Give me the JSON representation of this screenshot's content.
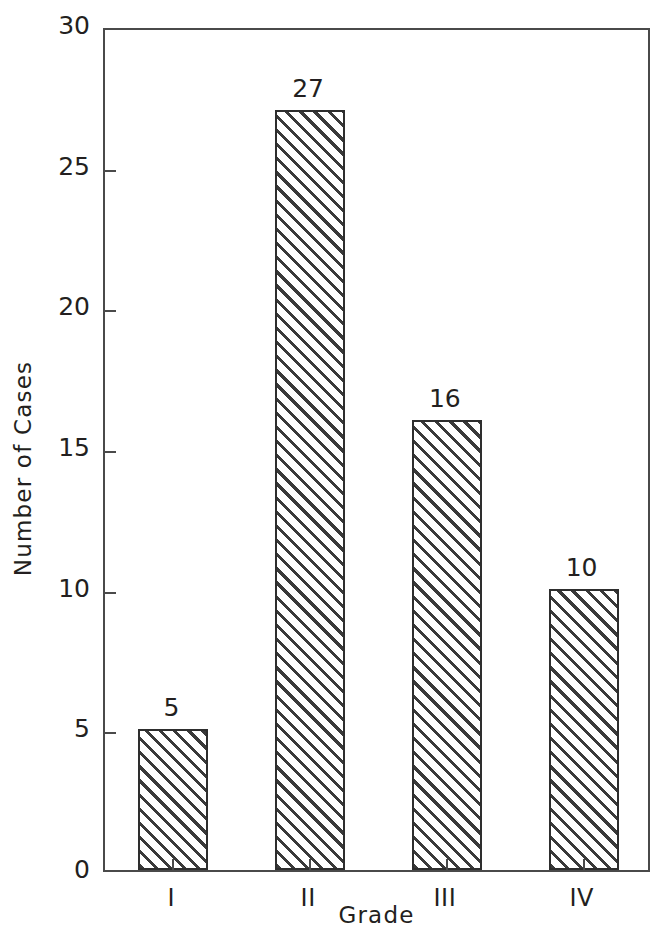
{
  "chart_data": {
    "type": "bar",
    "title": "",
    "subtitle": "",
    "xlabel": "Grade",
    "ylabel": "Number of Cases",
    "categories": [
      "I",
      "II",
      "III",
      "IV"
    ],
    "values": [
      5,
      27,
      16,
      10
    ],
    "value_labels": [
      "5",
      "27",
      "16",
      "10"
    ],
    "ylim": [
      0,
      30
    ],
    "yticks": [
      0,
      5,
      10,
      15,
      20,
      25,
      30
    ],
    "ytick_labels": [
      "0",
      "5",
      "10",
      "15",
      "20",
      "25",
      "30"
    ],
    "grid": false,
    "legend": false,
    "legend_position": "none",
    "bar_fill": "diagonal-hatch",
    "colors": {
      "axis": "#4a4a4a",
      "bar_edge": "#2e2e2e",
      "hatch": "#3a3a3a",
      "background": "#ffffff",
      "text": "#231f20"
    }
  }
}
